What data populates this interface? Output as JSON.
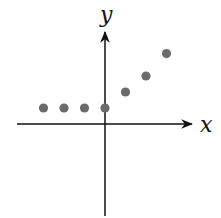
{
  "chart_data": {
    "type": "scatter",
    "title": "",
    "xlabel": "x",
    "ylabel": "y",
    "grid": false,
    "ticks": false,
    "points": [
      {
        "x": -3,
        "y": 1
      },
      {
        "x": -2,
        "y": 1
      },
      {
        "x": -1,
        "y": 1
      },
      {
        "x": 0,
        "y": 1
      },
      {
        "x": 1,
        "y": 2
      },
      {
        "x": 2,
        "y": 3
      },
      {
        "x": 3,
        "y": 4.4
      }
    ],
    "xlim": [
      -4.3,
      4.3
    ],
    "ylim": [
      -5.7,
      5.9
    ],
    "colors": {
      "points": "#6b6b6b",
      "axes": "#111111"
    }
  }
}
